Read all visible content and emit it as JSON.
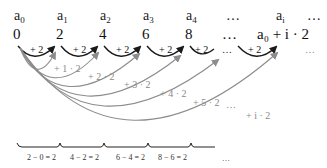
{
  "terms": [
    {
      "label": "a",
      "sub": "0",
      "x": 14
    },
    {
      "label": "a",
      "sub": "1",
      "x": 57
    },
    {
      "label": "a",
      "sub": "2",
      "x": 100
    },
    {
      "label": "a",
      "sub": "3",
      "x": 143
    },
    {
      "label": "a",
      "sub": "4",
      "x": 186
    },
    {
      "label": "…",
      "sub": "",
      "x": 228
    },
    {
      "label": "a",
      "sub": "i",
      "x": 276
    },
    {
      "label": "…",
      "sub": "",
      "x": 312
    }
  ],
  "values": [
    {
      "text": "0",
      "x": 14
    },
    {
      "text": "2",
      "x": 57
    },
    {
      "text": "4",
      "x": 100
    },
    {
      "text": "6",
      "x": 143
    },
    {
      "text": "8",
      "x": 186
    },
    {
      "text": "…",
      "x": 228
    },
    {
      "text": "a₀ + i · 2",
      "x": 258
    }
  ],
  "steps": {
    "label": "+ 2",
    "ellipsis": "…",
    "far_ellipsis": "…"
  },
  "cumulative": [
    {
      "text": "+ 1 · 2",
      "x": 55,
      "y": 72
    },
    {
      "text": "+ 2 · 2",
      "x": 90,
      "y": 80
    },
    {
      "text": "+ 3 · 2",
      "x": 125,
      "y": 88
    },
    {
      "text": "+ 4 · 2",
      "x": 160,
      "y": 96
    },
    {
      "text": "+ 5 · 2",
      "x": 195,
      "y": 105
    },
    {
      "text": "…",
      "x": 228,
      "y": 107
    },
    {
      "text": "+ i · 2",
      "x": 247,
      "y": 118
    }
  ],
  "differences": [
    {
      "text": "2 − 0 = 2",
      "x": 38
    },
    {
      "text": "4 − 2 = 2",
      "x": 80
    },
    {
      "text": "6 − 4 = 2",
      "x": 127
    },
    {
      "text": "8 − 6 = 2",
      "x": 172
    },
    {
      "text": "…",
      "x": 228
    }
  ],
  "colors": {
    "step_arc": "#1a1a1a",
    "cumulative_arc": "#8c8c8c",
    "brace": "#222222"
  }
}
